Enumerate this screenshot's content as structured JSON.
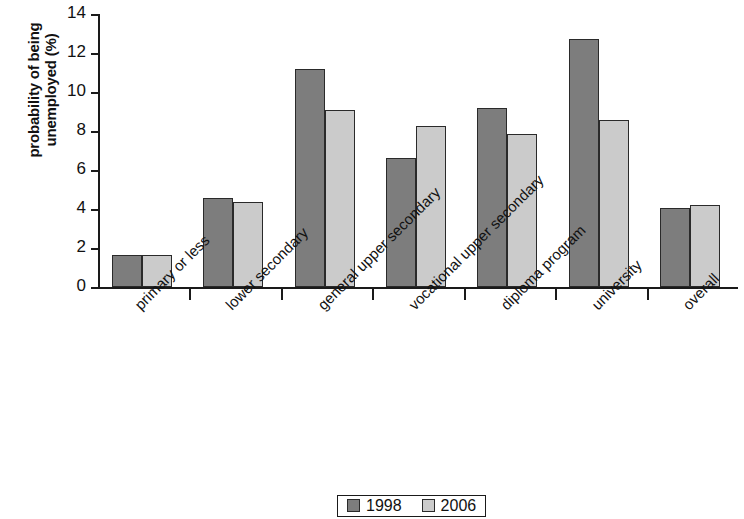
{
  "chart_data": {
    "type": "bar",
    "title": "",
    "xlabel": "",
    "ylabel": "probability of being unemployed (%)",
    "ylabel_line1": "probability of being",
    "ylabel_line2": "unemployed (%)",
    "ylim": [
      0,
      14
    ],
    "ytick_step": 2,
    "ytick_labels": [
      "0",
      "2",
      "4",
      "6",
      "8",
      "10",
      "12",
      "14"
    ],
    "grid": false,
    "legend_position": "bottom-center",
    "categories": [
      "primary or less",
      "lower secondary",
      "general upper secondary",
      "vocational upper secondary",
      "diploma program",
      "university",
      "overall"
    ],
    "series": [
      {
        "name": "1998",
        "color": "#7d7d7d",
        "values": [
          1.65,
          4.55,
          11.2,
          6.6,
          9.2,
          12.7,
          4.05
        ]
      },
      {
        "name": "2006",
        "color": "#cbcbcb",
        "values": [
          1.65,
          4.35,
          9.1,
          8.25,
          7.85,
          8.55,
          4.2
        ]
      }
    ]
  },
  "legend": {
    "items": [
      {
        "label": "1998",
        "swatch": "dark-gray-swatch-icon"
      },
      {
        "label": "2006",
        "swatch": "light-gray-swatch-icon"
      }
    ]
  },
  "colors": {
    "series_1998": "#7d7d7d",
    "series_2006": "#cbcbcb",
    "axis": "#1a1a1a",
    "background": "#ffffff"
  }
}
